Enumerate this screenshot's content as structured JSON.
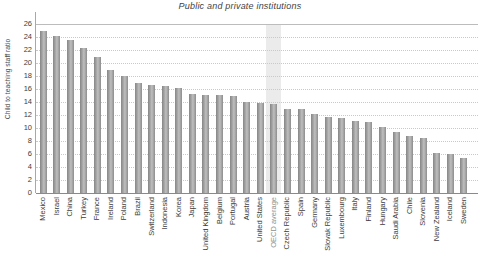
{
  "title": "Public and private institutions",
  "chart_data": {
    "type": "bar",
    "title": "Public and private institutions",
    "xlabel": "",
    "ylabel": "Child to teaching staff ratio",
    "ylim": [
      0,
      26
    ],
    "ytick_step": 2,
    "grid": "horizontal dotted gridlines, top line at 26 solid",
    "legend": "none",
    "bar_color_hex": "#9a9a9a",
    "highlight_band_color_hex": "#ebebeb",
    "highlighted_category": "OECD average",
    "categories": [
      "Mexico",
      "Israel",
      "China",
      "Turkey",
      "France",
      "Ireland",
      "Poland",
      "Brazil",
      "Switzerland",
      "Indonesia",
      "Korea",
      "Japan",
      "United Kingdom",
      "Belgium",
      "Portugal",
      "Austria",
      "United States",
      "OECD average",
      "Czech Republic",
      "Spain",
      "Germany",
      "Slovak Republic",
      "Luxembourg",
      "Italy",
      "Finland",
      "Hungary",
      "Saudi Arabia",
      "Chile",
      "Slovenia",
      "New Zealand",
      "Iceland",
      "Sweden"
    ],
    "values": [
      25.0,
      24.1,
      23.5,
      22.3,
      20.9,
      19.0,
      18.0,
      16.9,
      16.6,
      16.4,
      16.1,
      15.2,
      15.1,
      15.1,
      14.9,
      14.0,
      13.9,
      13.7,
      13.0,
      12.9,
      12.2,
      11.7,
      11.6,
      11.1,
      10.9,
      10.1,
      9.4,
      8.8,
      8.5,
      6.2,
      6.0,
      5.4
    ]
  }
}
